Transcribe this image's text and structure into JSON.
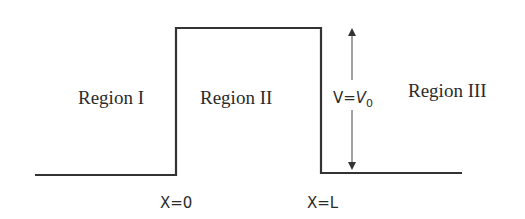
{
  "diagram": {
    "type": "potential-step-barrier",
    "regions": [
      {
        "label": "Region I"
      },
      {
        "label": "Region II"
      },
      {
        "label": "Region III"
      }
    ],
    "potential_label": {
      "prefix": "V=",
      "symbol": "V",
      "subscript": "0"
    },
    "boundaries": [
      {
        "label": "X=0"
      },
      {
        "label": "X=L"
      }
    ],
    "colors": {
      "line": "#333333",
      "text": "#2b2b2b",
      "background": "#ffffff"
    }
  }
}
